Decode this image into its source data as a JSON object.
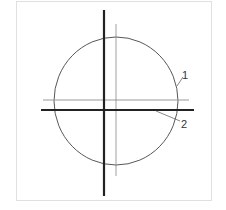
{
  "diagram": {
    "type": "technical-drawing",
    "labels": [
      {
        "id": "1",
        "text": "1",
        "refers_to": "circle"
      },
      {
        "id": "2",
        "text": "2",
        "refers_to": "thick horizontal axis"
      }
    ],
    "colors": {
      "thick_line": "#222222",
      "thin_line": "#888888",
      "circle": "#444444",
      "frame": "#e0e0e0"
    }
  }
}
